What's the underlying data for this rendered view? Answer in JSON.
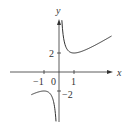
{
  "chart_data": {
    "type": "line",
    "title": "",
    "function": "y = x + 1/x",
    "xlabel": "x",
    "ylabel": "y",
    "x_ticks": [
      "-1",
      "0",
      "1"
    ],
    "y_ticks": [
      "2",
      "-2"
    ],
    "xlim": [
      -2,
      3.5
    ],
    "ylim": [
      -4,
      5.5
    ],
    "series": [
      {
        "name": "right branch",
        "x": [
          0.2,
          0.3,
          0.5,
          0.75,
          1,
          1.5,
          2,
          2.5,
          3.4
        ],
        "y": [
          5.2,
          3.63,
          2.5,
          2.08,
          2,
          2.17,
          2.5,
          2.9,
          3.69
        ]
      },
      {
        "name": "left branch",
        "x": [
          -1.9,
          -1.5,
          -1,
          -0.75,
          -0.5,
          -0.3,
          -0.2
        ],
        "y": [
          -2.43,
          -2.17,
          -2,
          -2.08,
          -2.5,
          -3.63,
          -5.2
        ]
      }
    ],
    "grid": false,
    "legend": null
  },
  "labels": {
    "x_axis": "x",
    "y_axis": "y",
    "tick_neg1": "−1",
    "tick_0": "0",
    "tick_1": "1",
    "tick_2": "2",
    "tick_neg2": "−2"
  }
}
